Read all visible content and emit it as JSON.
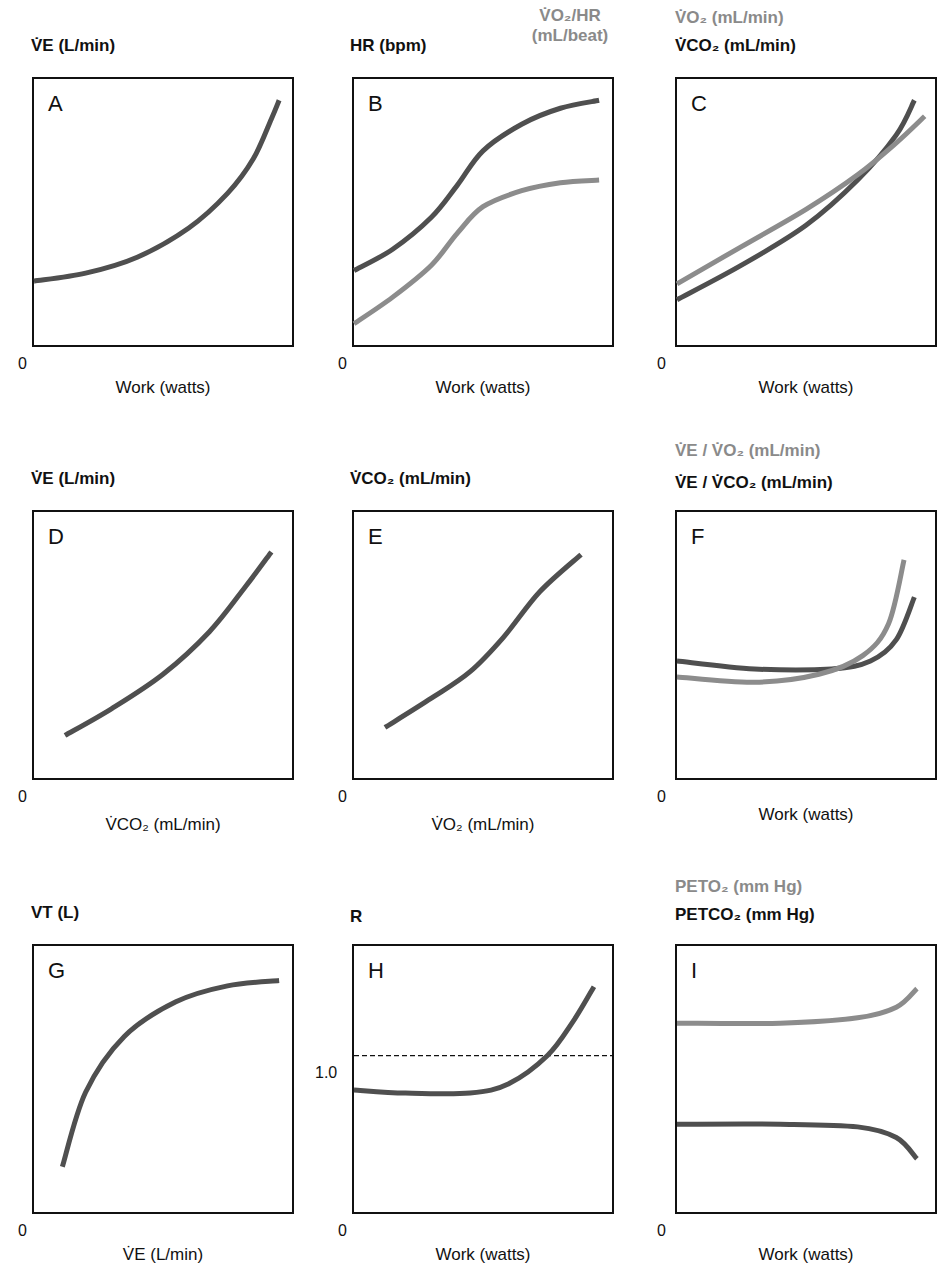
{
  "colors": {
    "dark": "#4f4f4f",
    "light": "#8c8c8c",
    "axis": "#111111"
  },
  "panels": {
    "A": {
      "letter": "A",
      "ylabel": "V̇E (L/min)",
      "xlabel": "Work (watts)",
      "zero": "0"
    },
    "B": {
      "letter": "B",
      "ylabel": "HR (bpm)",
      "ylabel2_line1": "V̇O₂/HR",
      "ylabel2_line2": "(mL/beat)",
      "xlabel": "Work (watts)",
      "zero": "0"
    },
    "C": {
      "letter": "C",
      "ylabel_grey": "V̇O₂ (mL/min)",
      "ylabel": "V̇CO₂ (mL/min)",
      "xlabel": "Work (watts)",
      "zero": "0"
    },
    "D": {
      "letter": "D",
      "ylabel": "V̇E (L/min)",
      "xlabel": "V̇CO₂ (mL/min)",
      "zero": "0"
    },
    "E": {
      "letter": "E",
      "ylabel": "V̇CO₂ (mL/min)",
      "xlabel": "V̇O₂ (mL/min)",
      "zero": "0"
    },
    "F": {
      "letter": "F",
      "ylabel_grey": "V̇E / V̇O₂ (mL/min)",
      "ylabel": "V̇E / V̇CO₂ (mL/min)",
      "xlabel": "Work (watts)",
      "zero": "0"
    },
    "G": {
      "letter": "G",
      "ylabel": "VT (L)",
      "xlabel": "V̇E (L/min)",
      "zero": "0"
    },
    "H": {
      "letter": "H",
      "ylabel": "R",
      "xlabel": "Work (watts)",
      "zero": "0",
      "ref_tick": "1.0"
    },
    "I": {
      "letter": "I",
      "ylabel_grey": "PETO₂ (mm Hg)",
      "ylabel": "PETCO₂ (mm Hg)",
      "xlabel": "Work (watts)",
      "zero": "0"
    }
  },
  "caption": "Figure (partially visible caption text cut off at bottom edge)",
  "chart_data": [
    {
      "panel": "A",
      "type": "line",
      "title": "",
      "xlabel": "Work (watts)",
      "ylabel": "V̇E (L/min)",
      "xlim": [
        0,
        100
      ],
      "ylim": [
        0,
        100
      ],
      "grid": false,
      "series": [
        {
          "name": "V̇E",
          "color": "dark",
          "x": [
            0,
            20,
            40,
            60,
            75,
            85,
            92,
            95
          ],
          "y": [
            24,
            27,
            33,
            44,
            57,
            70,
            85,
            92
          ]
        }
      ]
    },
    {
      "panel": "B",
      "type": "line",
      "xlabel": "Work (watts)",
      "ylabel": "HR (bpm)",
      "ylabel2": "V̇O₂/HR (mL/beat)",
      "xlim": [
        0,
        100
      ],
      "ylim": [
        0,
        100
      ],
      "grid": false,
      "series": [
        {
          "name": "HR",
          "color": "dark",
          "x": [
            0,
            15,
            30,
            40,
            50,
            65,
            80,
            95
          ],
          "y": [
            28,
            36,
            48,
            60,
            73,
            83,
            89,
            92
          ]
        },
        {
          "name": "V̇O₂/HR",
          "color": "light",
          "x": [
            0,
            15,
            30,
            40,
            50,
            65,
            80,
            95
          ],
          "y": [
            8,
            18,
            30,
            42,
            52,
            58,
            61,
            62
          ]
        }
      ]
    },
    {
      "panel": "C",
      "type": "line",
      "xlabel": "Work (watts)",
      "ylabel": "V̇CO₂ (mL/min)",
      "ylabel_grey": "V̇O₂ (mL/min)",
      "xlim": [
        0,
        100
      ],
      "ylim": [
        0,
        100
      ],
      "grid": false,
      "series": [
        {
          "name": "V̇CO₂",
          "color": "dark",
          "x": [
            0,
            25,
            50,
            70,
            85,
            92
          ],
          "y": [
            17,
            30,
            45,
            62,
            79,
            92
          ]
        },
        {
          "name": "V̇O₂",
          "color": "light",
          "x": [
            0,
            25,
            50,
            70,
            85,
            96
          ],
          "y": [
            23,
            37,
            51,
            64,
            76,
            86
          ]
        }
      ]
    },
    {
      "panel": "D",
      "type": "line",
      "xlabel": "V̇CO₂ (mL/min)",
      "ylabel": "V̇E (L/min)",
      "xlim": [
        0,
        100
      ],
      "ylim": [
        0,
        100
      ],
      "grid": false,
      "series": [
        {
          "name": "V̇E",
          "color": "dark",
          "x": [
            12,
            30,
            50,
            68,
            82,
            92
          ],
          "y": [
            16,
            26,
            39,
            55,
            72,
            85
          ]
        }
      ]
    },
    {
      "panel": "E",
      "type": "line",
      "xlabel": "V̇O₂ (mL/min)",
      "ylabel": "V̇CO₂ (mL/min)",
      "xlim": [
        0,
        100
      ],
      "ylim": [
        0,
        100
      ],
      "grid": false,
      "series": [
        {
          "name": "V̇CO₂",
          "color": "dark",
          "x": [
            12,
            30,
            45,
            58,
            72,
            88
          ],
          "y": [
            19,
            30,
            40,
            53,
            70,
            84
          ]
        }
      ]
    },
    {
      "panel": "F",
      "type": "line",
      "xlabel": "Work (watts)",
      "ylabel": "V̇E / V̇CO₂",
      "ylabel_grey": "V̇E / V̇O₂",
      "xlim": [
        0,
        100
      ],
      "ylim": [
        0,
        100
      ],
      "grid": false,
      "series": [
        {
          "name": "V̇E/V̇CO₂",
          "color": "dark",
          "x": [
            0,
            30,
            60,
            75,
            85,
            92
          ],
          "y": [
            44,
            41,
            41,
            44,
            52,
            68
          ]
        },
        {
          "name": "V̇E/V̇O₂",
          "color": "light",
          "x": [
            0,
            30,
            55,
            72,
            82,
            88
          ],
          "y": [
            38,
            36,
            39,
            46,
            58,
            82
          ]
        }
      ]
    },
    {
      "panel": "G",
      "type": "line",
      "xlabel": "V̇E (L/min)",
      "ylabel": "VT (L)",
      "xlim": [
        0,
        100
      ],
      "ylim": [
        0,
        100
      ],
      "grid": false,
      "series": [
        {
          "name": "VT",
          "color": "dark",
          "x": [
            11,
            20,
            35,
            55,
            75,
            95
          ],
          "y": [
            17,
            45,
            66,
            79,
            85,
            87
          ]
        }
      ]
    },
    {
      "panel": "H",
      "type": "line",
      "xlabel": "Work (watts)",
      "ylabel": "R",
      "xlim": [
        0,
        100
      ],
      "ylim": [
        0,
        1.7
      ],
      "grid": false,
      "reference_line": {
        "y": 1.0,
        "style": "dashed",
        "label": "1.0"
      },
      "series": [
        {
          "name": "R",
          "color": "dark",
          "x": [
            0,
            20,
            45,
            60,
            75,
            85,
            93
          ],
          "y": [
            0.78,
            0.76,
            0.76,
            0.82,
            1.0,
            1.22,
            1.44
          ]
        }
      ]
    },
    {
      "panel": "I",
      "type": "line",
      "xlabel": "Work (watts)",
      "ylabel": "PETCO₂ (mm Hg)",
      "ylabel_grey": "PETO₂ (mm Hg)",
      "xlim": [
        0,
        100
      ],
      "ylim": [
        0,
        100
      ],
      "grid": false,
      "series": [
        {
          "name": "PETO₂",
          "color": "light",
          "x": [
            0,
            40,
            70,
            85,
            93
          ],
          "y": [
            71,
            71,
            73,
            77,
            84
          ]
        },
        {
          "name": "PETCO₂",
          "color": "dark",
          "x": [
            0,
            40,
            70,
            85,
            93
          ],
          "y": [
            33,
            33,
            32,
            28,
            20
          ]
        }
      ]
    }
  ]
}
